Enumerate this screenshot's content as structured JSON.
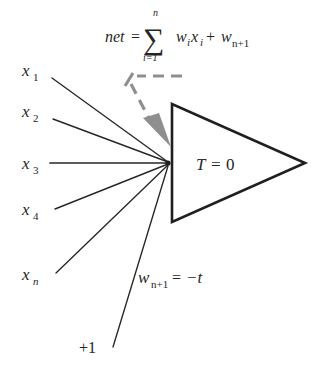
{
  "diagram": {
    "formula": {
      "lhs": "net",
      "equals": "=",
      "sigma": "∑",
      "sigma_upper": "n",
      "sigma_lower": "i=1",
      "term_w": "w",
      "term_w_sub": "i",
      "term_x": "x",
      "term_x_sub": "i",
      "plus": "+",
      "bias_w": "w",
      "bias_w_sub": "n+1"
    },
    "inputs": [
      {
        "label": "x",
        "sub": "1"
      },
      {
        "label": "x",
        "sub": "2"
      },
      {
        "label": "x",
        "sub": "3"
      },
      {
        "label": "x",
        "sub": "4"
      },
      {
        "label": "x",
        "sub": "n"
      }
    ],
    "bias_input": {
      "label": "+1"
    },
    "bias_weight": {
      "symbol": "w",
      "sub": "n+1",
      "equals": "=",
      "value": "−t"
    },
    "neuron": {
      "threshold_symbol": "T",
      "threshold_equals": "=",
      "threshold_value": "0"
    },
    "annotation_arrow": {
      "name": "net-input-pointer"
    },
    "colors": {
      "ink": "#262626",
      "outline": "#1f1f1f",
      "arrow_gray": "#8f8f8f",
      "background": "#ffffff"
    }
  }
}
